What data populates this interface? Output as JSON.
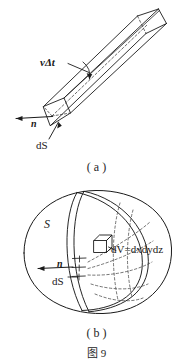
{
  "figure": {
    "number_caption": "图 9",
    "panels": [
      {
        "id": "a",
        "caption": "( a )",
        "labels": {
          "length": "vΔt",
          "normal": "n",
          "area_element": "dS"
        }
      },
      {
        "id": "b",
        "caption": "( b )",
        "labels": {
          "surface": "S",
          "normal": "n",
          "area_element": "dS",
          "volume_element": "dV=dxdydz"
        }
      }
    ]
  },
  "colors": {
    "background": "#ffffff",
    "ink": "#1a1a1a",
    "ink_soft": "#262626",
    "dash": "#3a3a3a"
  }
}
